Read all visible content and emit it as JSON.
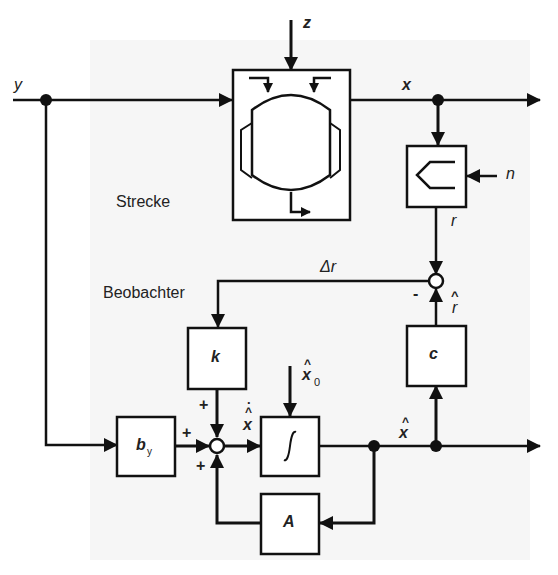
{
  "diagram": {
    "regions": {
      "plant_label": "Strecke",
      "observer_label": "Beobachter"
    },
    "signals": {
      "input": "y",
      "disturbance": "z",
      "state": "x",
      "noise": "n",
      "measurement": "r",
      "estimated_measurement": "r",
      "residual": "Δr",
      "estimated_state": "x",
      "estimated_state_derivative": "x",
      "initial_state": "x",
      "initial_state_subscript": "0",
      "hat": "^",
      "dot": "·"
    },
    "blocks": {
      "plant": "reactor-vessel",
      "sensor": "sensor",
      "gain_k": "k",
      "input_gain": "b",
      "input_gain_subscript": "y",
      "integrator": "∫",
      "output_c": "c",
      "system_A": "A"
    },
    "signs": {
      "sum_observer_top": "+",
      "sum_observer_left": "+",
      "sum_observer_bottom": "+",
      "sum_residual_minus": "-"
    }
  }
}
